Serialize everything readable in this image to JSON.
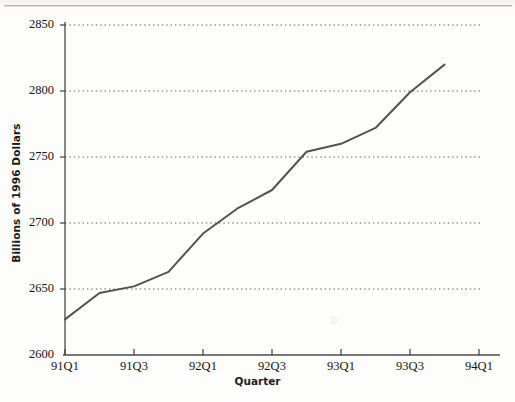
{
  "chart_data": {
    "type": "line",
    "title": "",
    "xlabel": "Quarter",
    "ylabel": "Billions of 1996 Dollars",
    "ylim": [
      2600,
      2850
    ],
    "ytick_labels": [
      "2600",
      "2650",
      "2700",
      "2750",
      "2800",
      "2850"
    ],
    "ytick_values": [
      2600,
      2650,
      2700,
      2750,
      2800,
      2850
    ],
    "xtick_labels": [
      "91Q1",
      "91Q3",
      "92Q1",
      "92Q3",
      "93Q1",
      "93Q3",
      "94Q1"
    ],
    "xtick_values": [
      "91Q1",
      "91Q3",
      "92Q1",
      "92Q3",
      "93Q1",
      "93Q3",
      "94Q1"
    ],
    "xlim": [
      "91Q1",
      "94Q1"
    ],
    "grid": "horizontal-dotted",
    "legend": "none",
    "line_color": "#4a4a4a",
    "categories": [
      "91Q1",
      "91Q2",
      "91Q3",
      "91Q4",
      "92Q1",
      "92Q2",
      "92Q3",
      "92Q4",
      "93Q1",
      "93Q2",
      "93Q3",
      "93Q4"
    ],
    "values": [
      2627,
      2647,
      2652,
      2663,
      2692,
      2711,
      2725,
      2754,
      2760,
      2772,
      2799,
      2820
    ],
    "series": [
      {
        "name": "Real GDP",
        "values": [
          2627,
          2647,
          2652,
          2663,
          2692,
          2711,
          2725,
          2754,
          2760,
          2772,
          2799,
          2820
        ]
      }
    ]
  },
  "axes": {
    "y_title": "Billions of 1996 Dollars",
    "x_title": "Quarter"
  }
}
